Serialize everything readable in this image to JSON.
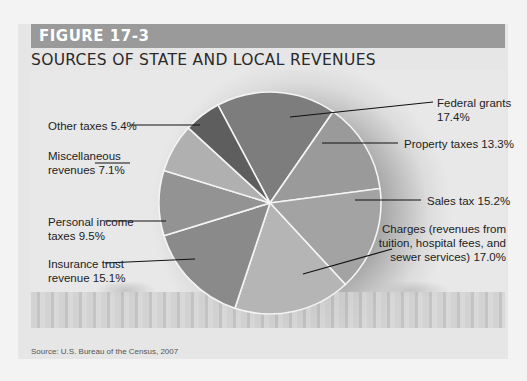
{
  "figure": {
    "label": "FIGURE 17-3",
    "title": "SOURCES OF STATE AND LOCAL REVENUES",
    "source": "Source: U.S. Bureau of the Census, 2007"
  },
  "labels": {
    "federal": "Federal grants 17.4%",
    "property": "Property taxes 13.3%",
    "sales": "Sales tax 15.2%",
    "charges_1": "Charges (revenues from",
    "charges_2": "tuition, hospital fees, and",
    "charges_3": "sewer services) 17.0%",
    "insurance_1": "Insurance trust",
    "insurance_2": "revenue  15.1%",
    "personal_1": "Personal income",
    "personal_2": "taxes  9.5%",
    "misc_1": "Miscellaneous",
    "misc_2": "revenues  7.1%",
    "other": "Other taxes 5.4%"
  },
  "chart_data": {
    "type": "pie",
    "title": "Sources of State and Local Revenues",
    "categories": [
      "Federal grants",
      "Property taxes",
      "Sales tax",
      "Charges (revenues from tuition, hospital fees, and sewer services)",
      "Insurance trust revenue",
      "Personal income taxes",
      "Miscellaneous revenues",
      "Other taxes"
    ],
    "values": [
      17.4,
      13.3,
      15.2,
      17.0,
      15.1,
      9.5,
      7.1,
      5.4
    ],
    "unit": "%",
    "colors": [
      "#7d7d7d",
      "#9a9a9a",
      "#a3a3a3",
      "#b5b5b5",
      "#8a8a8a",
      "#939393",
      "#b0b0b0",
      "#5e5e5e"
    ],
    "source": "U.S. Bureau of the Census, 2007",
    "legend": "callout labels"
  }
}
